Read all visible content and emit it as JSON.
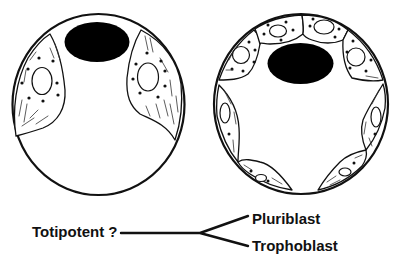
{
  "figure": {
    "panels": [
      {
        "id": "early-blastocyst",
        "description": "Circle with black inner mass at top and two flat cells at left and right sides"
      },
      {
        "id": "late-blastocyst",
        "description": "Circle with black inner mass at top, four cells lining the top, and four flattened cells around the rest of the perimeter"
      }
    ],
    "lineage": {
      "source_label": "Totipotent ?",
      "branches": [
        {
          "label": "Pluriblast"
        },
        {
          "label": "Trophoblast"
        }
      ]
    },
    "colors": {
      "stroke": "#111111",
      "inner_mass_fill": "#000000",
      "background": "#ffffff"
    }
  }
}
